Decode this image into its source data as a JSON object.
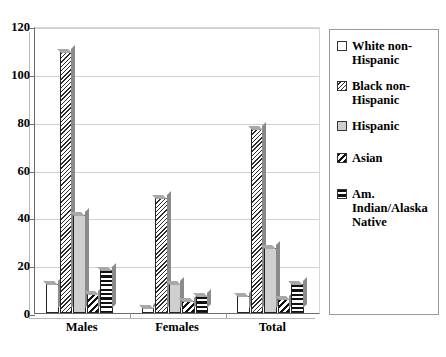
{
  "chart_data": {
    "type": "bar",
    "title": "",
    "xlabel": "",
    "ylabel": "",
    "ylim": [
      0,
      120
    ],
    "ytick_labels": [
      "0",
      "20",
      "40",
      "60",
      "80",
      "100",
      "120"
    ],
    "ytick_values": [
      0,
      20,
      40,
      60,
      80,
      100,
      120
    ],
    "grid": true,
    "legend_position": "right",
    "categories": [
      "Males",
      "Females",
      "Total"
    ],
    "series": [
      {
        "name": "White non-Hispanic",
        "pattern": "solid-white",
        "values": [
          12,
          2,
          7
        ]
      },
      {
        "name": "Black non-Hispanic",
        "pattern": "fine-diagonal",
        "values": [
          109,
          48,
          77
        ]
      },
      {
        "name": "Hispanic",
        "pattern": "solid-gray",
        "values": [
          41,
          12,
          27
        ]
      },
      {
        "name": "Asian",
        "pattern": "bold-diagonal",
        "values": [
          8,
          5,
          6
        ]
      },
      {
        "name": "Am. Indian/Alaska Native",
        "pattern": "horizontal-lines",
        "values": [
          18,
          7,
          12
        ]
      }
    ]
  },
  "legend": {
    "items": [
      {
        "label": "White non-Hispanic"
      },
      {
        "label": "Black non-Hispanic"
      },
      {
        "label": "Hispanic"
      },
      {
        "label": "Asian"
      },
      {
        "label": "Am. Indian/Alaska Native"
      }
    ]
  },
  "colors": {
    "axis": "#6b6b6b",
    "gridline": "#cfcfcf",
    "hispanic_fill": "#cfcfcf",
    "hatch_ink": "#1a1a1a",
    "background": "#ffffff",
    "bar_side_3d": "#8a8a8a"
  }
}
